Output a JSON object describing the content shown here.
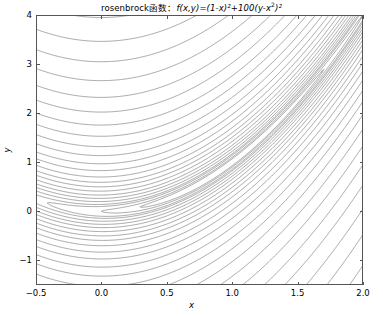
{
  "chart_data": {
    "type": "line",
    "plot_kind": "contour",
    "title_parts": {
      "name": "rosenbrock函数：",
      "func": "f",
      "args": "(x,y)",
      "equals": "=(1-",
      "x1": "x",
      "pow1": "2",
      "plus": ")²+100(",
      "y1": "y",
      "minus": "-",
      "x2": "x",
      "pow2": "2",
      "tail": ")²"
    },
    "function": "f(x,y)=(1-x)^2+100*(y-x^2)^2",
    "xlabel": "x",
    "ylabel": "y",
    "xlim": [
      -0.5,
      2.0
    ],
    "ylim": [
      -1.5,
      4.0
    ],
    "xticks": [
      "-0.5",
      "0.0",
      "0.5",
      "1.0",
      "1.5",
      "2.0"
    ],
    "xtick_values": [
      -0.5,
      0.0,
      0.5,
      1.0,
      1.5,
      2.0
    ],
    "yticks": [
      "-1",
      "0",
      "1",
      "2",
      "3",
      "4"
    ],
    "ytick_values": [
      -1,
      0,
      1,
      2,
      3,
      4
    ],
    "grid": false,
    "legend": null,
    "line_color": "#555555",
    "background_color": "#ffffff",
    "contour_levels": [
      0.5,
      1,
      2,
      3,
      5,
      8,
      12,
      18,
      26,
      36,
      50,
      70,
      95,
      130,
      175,
      235,
      310,
      410,
      540,
      710,
      930,
      1200,
      1560,
      2000,
      2600,
      3300,
      4200,
      5400,
      6900,
      8800,
      11000,
      14000,
      18000,
      23000,
      29000,
      37000,
      47000,
      60000,
      76000,
      96000
    ],
    "minimum_point": [
      1.0,
      1.0
    ],
    "minimum_value": 0,
    "valley_curve": "y = x^2",
    "n_levels": 40
  }
}
